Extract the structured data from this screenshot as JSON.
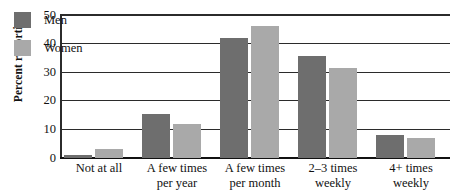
{
  "chart_data": {
    "type": "bar",
    "title": "",
    "subtitle": "",
    "xlabel": "",
    "ylabel": "Percent reporting",
    "ylim": [
      0,
      50
    ],
    "yticks": [
      0,
      10,
      20,
      30,
      40,
      50
    ],
    "ytick_labels": [
      "0",
      "10",
      "20",
      "30",
      "40",
      "50"
    ],
    "grid": true,
    "grid_axis": "y",
    "legend_position": "inside top-left",
    "categories": [
      "Not at all",
      "A few times per year",
      "A few times per month",
      "2–3 times weekly",
      "4+ times weekly"
    ],
    "category_lines": [
      [
        "Not at all",
        ""
      ],
      [
        "A few times",
        "per year"
      ],
      [
        "A few times",
        "per month"
      ],
      [
        "2–3 times",
        "weekly"
      ],
      [
        "4+ times",
        "weekly"
      ]
    ],
    "series": [
      {
        "name": "Men",
        "color": "#6e6e6e",
        "values": [
          1,
          15.5,
          42,
          35.5,
          8
        ]
      },
      {
        "name": "Women",
        "color": "#a9a9a9",
        "values": [
          3,
          12,
          46,
          31.5,
          7
        ]
      }
    ]
  },
  "legend": {
    "items": [
      {
        "label": "Men",
        "color": "#6e6e6e"
      },
      {
        "label": "Women",
        "color": "#a9a9a9"
      }
    ]
  },
  "axis": {
    "y_title": "Percent reporting"
  }
}
